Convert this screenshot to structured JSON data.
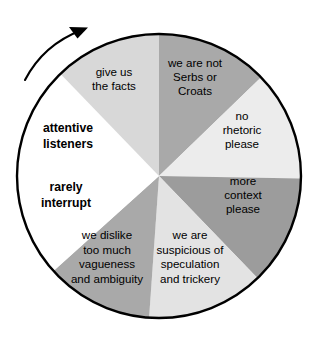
{
  "figure": {
    "background_color": "#ffffff",
    "outline_color": "#000000"
  },
  "chart_data": {
    "type": "pie",
    "title": "",
    "subtitle": "",
    "xlabel": "",
    "ylabel": "",
    "legend_position": "none",
    "grid": false,
    "center": {
      "x": 159,
      "y": 176
    },
    "radius": 142,
    "equal_slices": false,
    "slice_count": 8,
    "categories": [
      "we are not Serbs or Croats",
      "no rhetoric please",
      "more context please",
      "we are suspicious of speculation and trickery",
      "we dislike too much vagueness and ambiguity",
      "rarely interrupt",
      "attentive listeners",
      "give us the facts"
    ],
    "values": [
      46,
      45,
      45,
      48,
      44,
      44,
      44,
      44
    ],
    "colors": [
      "#a9a9a9",
      "#ececec",
      "#9c9c9c",
      "#e3e3e3",
      "#a9a9a9",
      "#ffffff",
      "#ffffff",
      "#d8d8d8"
    ],
    "series": [
      {
        "name": "sectors",
        "values": [
          46,
          45,
          45,
          48,
          44,
          44,
          44,
          44
        ]
      }
    ]
  },
  "wheel": {
    "rotation_arrow": {
      "name": "clockwise-rotation-arrow",
      "direction": "clockwise"
    },
    "sectors": [
      {
        "id": "sector-serbs-croats",
        "color": "#a9a9a9",
        "start_angle": -90,
        "end_angle": -44,
        "bold": false,
        "label_x": 195,
        "label_y": 78,
        "lines": [
          "we are not",
          "Serbs or",
          "Croats"
        ]
      },
      {
        "id": "sector-no-rhetoric",
        "color": "#ececec",
        "start_angle": -44,
        "end_angle": 1,
        "bold": false,
        "label_x": 242,
        "label_y": 131,
        "lines": [
          "no",
          "rhetoric",
          "please"
        ]
      },
      {
        "id": "sector-more-context",
        "color": "#9c9c9c",
        "start_angle": 1,
        "end_angle": 46,
        "bold": false,
        "label_x": 243,
        "label_y": 196,
        "lines": [
          "more",
          "context",
          "please"
        ]
      },
      {
        "id": "sector-suspicious",
        "color": "#e3e3e3",
        "start_angle": 46,
        "end_angle": 94,
        "bold": false,
        "label_x": 190,
        "label_y": 258,
        "lines": [
          "we are",
          "suspicious of",
          "speculation",
          "and trickery"
        ]
      },
      {
        "id": "sector-vagueness",
        "color": "#a9a9a9",
        "start_angle": 94,
        "end_angle": 138,
        "bold": false,
        "label_x": 107,
        "label_y": 258,
        "lines": [
          "we dislike",
          "too much",
          "vagueness",
          "and ambiguity"
        ]
      },
      {
        "id": "sector-rarely-interrupt",
        "color": "#ffffff",
        "start_angle": 138,
        "end_angle": 182,
        "bold": true,
        "label_x": 66,
        "label_y": 196,
        "lines": [
          "rarely",
          "interrupt"
        ]
      },
      {
        "id": "sector-attentive-listeners",
        "color": "#ffffff",
        "start_angle": 182,
        "end_angle": 226,
        "bold": true,
        "label_x": 68,
        "label_y": 137,
        "lines": [
          "attentive",
          "listeners"
        ]
      },
      {
        "id": "sector-give-us-facts",
        "color": "#d8d8d8",
        "start_angle": 226,
        "end_angle": 270,
        "bold": false,
        "label_x": 114,
        "label_y": 80,
        "lines": [
          "give us",
          "the facts"
        ]
      }
    ]
  }
}
